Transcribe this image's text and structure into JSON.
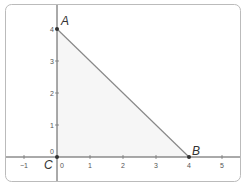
{
  "figure": {
    "type": "coordinate-plane-triangle",
    "frame": {
      "x": 5,
      "y": 4,
      "width": 236,
      "height": 178,
      "radius": 6,
      "stroke": "#bbbbbb"
    },
    "origin_px": {
      "x": 57,
      "y": 157
    },
    "unit_px": {
      "x": 33,
      "y": 32
    },
    "axis_color": "#555555",
    "fill_color": "#f6f6f6",
    "edge_color": "#888888",
    "point_color": "#333333"
  },
  "x_ticks": [
    {
      "value": -1,
      "label": "−1"
    },
    {
      "value": 0,
      "label": "0"
    },
    {
      "value": 1,
      "label": "1"
    },
    {
      "value": 2,
      "label": "2"
    },
    {
      "value": 3,
      "label": "3"
    },
    {
      "value": 4,
      "label": "4"
    },
    {
      "value": 5,
      "label": "5"
    }
  ],
  "y_ticks": [
    {
      "value": 0,
      "label": "0"
    },
    {
      "value": 1,
      "label": "1"
    },
    {
      "value": 2,
      "label": "2"
    },
    {
      "value": 3,
      "label": "3"
    },
    {
      "value": 4,
      "label": "4"
    }
  ],
  "points": [
    {
      "name": "A",
      "x": 0,
      "y": 4
    },
    {
      "name": "B",
      "x": 4,
      "y": 0
    },
    {
      "name": "C",
      "x": 0,
      "y": 0
    }
  ]
}
